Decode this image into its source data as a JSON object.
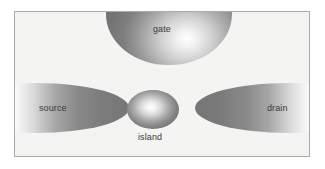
{
  "figure": {
    "type": "single-electron-transistor-schematic",
    "background_color": "#f4f4f3",
    "border_color": "#a9a9a9",
    "page_background": "#ffffff",
    "label_color": "#3a3a3a"
  },
  "elements": {
    "gate": {
      "label": "gate",
      "shape": "circle",
      "position": "top-center",
      "clipped": "top-edge"
    },
    "source": {
      "label": "source",
      "shape": "ellipse",
      "position": "middle-left",
      "clipped": "left-edge"
    },
    "drain": {
      "label": "drain",
      "shape": "ellipse",
      "position": "middle-right",
      "clipped": "right-edge"
    },
    "island": {
      "label": "island",
      "shape": "ellipse",
      "position": "center"
    }
  }
}
